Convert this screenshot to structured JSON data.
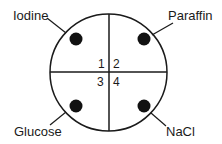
{
  "diagram": {
    "type": "petri-dish-quadrants",
    "quadrants": [
      {
        "number": "1",
        "label": "Iodine",
        "position": "top-left"
      },
      {
        "number": "2",
        "label": "Paraffin",
        "position": "top-right"
      },
      {
        "number": "3",
        "label": "Glucose",
        "position": "bottom-left"
      },
      {
        "number": "4",
        "label": "NaCl",
        "position": "bottom-right"
      }
    ]
  }
}
